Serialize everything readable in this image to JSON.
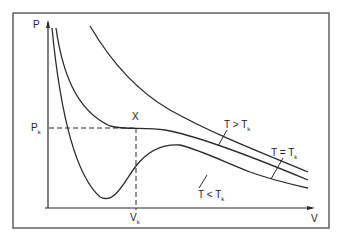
{
  "diagram": {
    "axes": {
      "y_label": "P",
      "x_label": "V",
      "critical_pressure": {
        "main": "P",
        "sub": "k"
      },
      "critical_volume": {
        "main": "V",
        "sub": "k"
      }
    },
    "critical_point_label": "X",
    "curves": [
      {
        "id": "above",
        "label": {
          "main": "T > T",
          "sub": "k"
        }
      },
      {
        "id": "critical",
        "label": {
          "main": "T = T",
          "sub": "k"
        }
      },
      {
        "id": "below",
        "label": {
          "main": "T < T",
          "sub": "k"
        }
      }
    ]
  }
}
